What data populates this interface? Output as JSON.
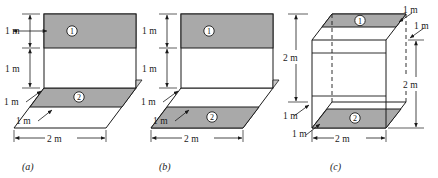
{
  "figure": {
    "caption_a": "(a)",
    "caption_b": "(b)",
    "caption_c": "(c)",
    "region_one_label": "1",
    "region_two_label": "2",
    "colors": {
      "shade": "#a9a9a9",
      "line": "#1a1a1a",
      "background": "#ffffff",
      "text": "#1a1a1a"
    }
  },
  "panel_a": {
    "name": "(a)",
    "dims": {
      "left_top": "1 m",
      "left_mid": "1 m",
      "left_depth_upper": "1 m",
      "left_depth_lower": "1 m",
      "bottom_width": "2 m"
    },
    "regions": [
      {
        "id": "1",
        "location": "upper band of vertical panel"
      },
      {
        "id": "2",
        "location": "far band of base"
      }
    ]
  },
  "panel_b": {
    "name": "(b)",
    "dims": {
      "left_top": "1 m",
      "left_mid": "1 m",
      "left_depth_upper": "1 m",
      "left_depth_lower": "1 m",
      "bottom_width": "2 m"
    },
    "regions": [
      {
        "id": "1",
        "location": "upper band of vertical panel"
      },
      {
        "id": "2",
        "location": "near band of base"
      }
    ]
  },
  "panel_c": {
    "name": "(c)",
    "dims": {
      "left_height": "2 m",
      "left_depth_upper": "1 m",
      "left_depth_lower": "1 m",
      "right_depth_upper": "1 m",
      "right_depth_lower": "1 m",
      "right_height": "2 m",
      "bottom_width": "2 m"
    },
    "regions": [
      {
        "id": "1",
        "location": "top face band"
      },
      {
        "id": "2",
        "location": "bottom face band"
      }
    ]
  }
}
